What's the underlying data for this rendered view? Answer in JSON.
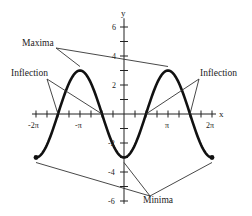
{
  "chart_data": {
    "type": "line",
    "title": "",
    "function": "y = -3cos(x)",
    "xlabel": "x",
    "ylabel": "y",
    "xlim": [
      -6.2832,
      6.2832
    ],
    "ylim": [
      -6,
      6
    ],
    "grid": false,
    "legend": null,
    "x_tick_labels": [
      "-2π",
      "-π",
      "π",
      "2π"
    ],
    "x_tick_values": [
      -6.2832,
      -3.1416,
      3.1416,
      6.2832
    ],
    "x_minor_tick_step": 0.7854,
    "y_tick_labels": [
      "6",
      "4",
      "2",
      "-2",
      "-4",
      "-6"
    ],
    "y_tick_values": [
      6,
      4,
      2,
      -2,
      -4,
      -6
    ],
    "y_minor_tick_step": 1,
    "series": [
      {
        "name": "-3cos(x)",
        "x": [
          -6.2832,
          -5.4978,
          -4.7124,
          -3.927,
          -3.1416,
          -2.3562,
          -1.5708,
          -0.7854,
          0,
          0.7854,
          1.5708,
          2.3562,
          3.1416,
          3.927,
          4.7124,
          5.4978,
          6.2832
        ],
        "values": [
          -3,
          -2.12,
          0,
          2.12,
          3,
          2.12,
          0,
          -2.12,
          -3,
          -2.12,
          0,
          2.12,
          3,
          2.12,
          0,
          -2.12,
          -3
        ],
        "color": "#111111",
        "endpoints_marked": true
      }
    ],
    "annotations": [
      {
        "text": "Maxima",
        "points": [
          [
            -3.1416,
            3
          ],
          [
            3.1416,
            3
          ]
        ]
      },
      {
        "text": "Inflection",
        "side": "left",
        "points": [
          [
            -4.7124,
            0
          ],
          [
            -1.5708,
            0
          ]
        ]
      },
      {
        "text": "Inflection",
        "side": "right",
        "points": [
          [
            1.5708,
            0
          ],
          [
            4.7124,
            0
          ]
        ]
      },
      {
        "text": "Minima",
        "points": [
          [
            -6.2832,
            -3
          ],
          [
            0,
            -3
          ],
          [
            6.2832,
            -3
          ]
        ]
      }
    ]
  },
  "labels": {
    "x_axis": "x",
    "y_axis": "y",
    "maxima": "Maxima",
    "inflection_left": "Inflection",
    "inflection_right": "Inflection",
    "minima": "Minima",
    "xt_m2pi": "-2π",
    "xt_mpi": "-π",
    "xt_pi": "π",
    "xt_2pi": "2π",
    "yt_6": "6",
    "yt_4": "4",
    "yt_2": "2",
    "yt_m2": "-2",
    "yt_m4": "-4",
    "yt_m6": "-6"
  },
  "colors": {
    "curve": "#111111",
    "axis": "#222222",
    "leader": "#333333",
    "background": "#ffffff"
  }
}
